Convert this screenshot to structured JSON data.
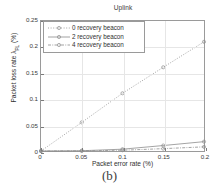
{
  "figure": {
    "subcaption": "(b)"
  },
  "chart_data": {
    "type": "line",
    "title": "Uplink",
    "xlabel": "Packet error rate (%)",
    "ylabel_main": "Packet loss rate λ",
    "ylabel_sub": "PL",
    "ylabel_unit": " (%)",
    "xlim": [
      0,
      0.2
    ],
    "ylim": [
      0,
      0.25
    ],
    "xticks": [
      0,
      0.05,
      0.1,
      0.15,
      0.2
    ],
    "xticklabels": [
      "0",
      "0.05",
      "0.1",
      "0.15",
      "0.2"
    ],
    "yticks": [
      0,
      0.05,
      0.1,
      0.15,
      0.2,
      0.25
    ],
    "yticklabels": [
      "0",
      "0.05",
      "0.1",
      "0.15",
      "0.2",
      "0.25"
    ],
    "grid": true,
    "legend_position": "upper left",
    "x": [
      0,
      0.05,
      0.1,
      0.15,
      0.2
    ],
    "series": [
      {
        "name": "0 recovery beacon",
        "values": [
          0,
          0.055,
          0.111,
          0.161,
          0.21
        ],
        "marker": "circle",
        "linestyle": "dotted",
        "color": "#8c8c8c"
      },
      {
        "name": "2 recovery beacon",
        "values": [
          0,
          0.0005,
          0.0035,
          0.0105,
          0.018
        ],
        "marker": "circle",
        "linestyle": "solid",
        "color": "#8c8c8c"
      },
      {
        "name": "4 recovery beacon",
        "values": [
          0,
          0.0002,
          0.0015,
          0.0045,
          0.008
        ],
        "marker": "circle",
        "linestyle": "dashdot",
        "color": "#8c8c8c"
      }
    ]
  }
}
